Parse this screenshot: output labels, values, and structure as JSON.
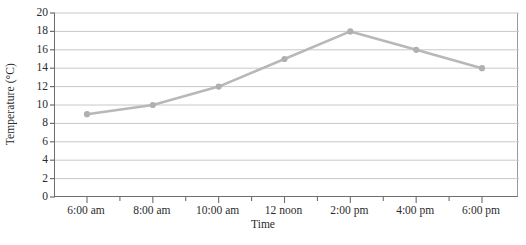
{
  "chart_data": {
    "type": "line",
    "title": "",
    "xlabel": "Time",
    "ylabel": "Temperature (°C)",
    "categories": [
      "6:00 am",
      "8:00 am",
      "10:00 am",
      "12 noon",
      "2:00 pm",
      "4:00 pm",
      "6:00 pm"
    ],
    "values": [
      9,
      10,
      12,
      15,
      18,
      16,
      14
    ],
    "series": [
      {
        "name": "Temperature",
        "values": [
          9,
          10,
          12,
          15,
          18,
          16,
          14
        ]
      }
    ],
    "ylim": [
      0,
      20
    ],
    "y_ticks": [
      0,
      2,
      4,
      6,
      8,
      10,
      12,
      14,
      16,
      18,
      20
    ],
    "y_ticklabels": [
      "0",
      "2",
      "4",
      "6",
      "8",
      "10",
      "12",
      "14",
      "16",
      "18",
      "20"
    ],
    "x_ticklabels": [
      "6:00 am",
      "8:00 am",
      "10:00 am",
      "12 noon",
      "2:00 pm",
      "4:00 pm",
      "6:00 pm"
    ],
    "x_minor_ticks_between": 1,
    "grid": "horizontal",
    "legend": "none",
    "colors": {
      "line": "#b8b8b8",
      "marker": "#b0b0b0",
      "gridline": "#c8c8c8",
      "axis": "#6e6e6e",
      "text": "#2b2b2b"
    }
  }
}
